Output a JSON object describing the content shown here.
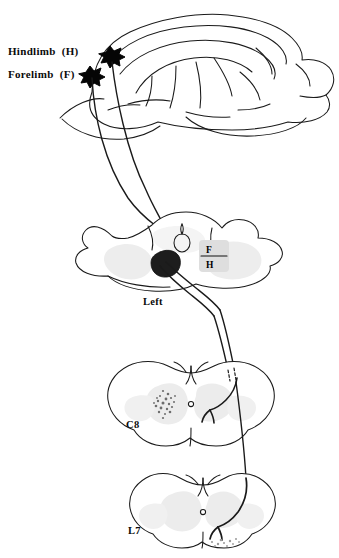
{
  "figure": {
    "background_color": "#ffffff",
    "ink_color": "#000000",
    "gray_matter_color": "#e8e8e8"
  },
  "labels": {
    "hindlimb": "Hindlimb  (H)",
    "forelimb": "Forelimb  (F)",
    "left": "Left",
    "c8": "C8",
    "l7": "L7",
    "fh_top": "F",
    "fh_bottom": "H"
  },
  "panels": [
    {
      "name": "cortex",
      "label": "",
      "description": "lateral view of brain with two cortical injection sites"
    },
    {
      "name": "medulla",
      "label": "Left",
      "description": "medullary cross-section with pyramid lesion and F/H marker"
    },
    {
      "name": "cervical",
      "label": "C8",
      "description": "C8 spinal cord cross-section with labelled terminals"
    },
    {
      "name": "lumbar",
      "label": "L7",
      "description": "L7 spinal cord cross-section with labelled terminals"
    }
  ],
  "injection_sites": [
    {
      "name": "hindlimb-site",
      "code": "H"
    },
    {
      "name": "forelimb-site",
      "code": "F"
    }
  ]
}
